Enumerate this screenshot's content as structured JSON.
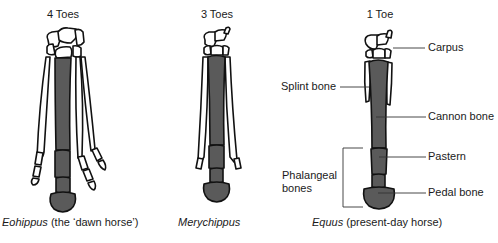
{
  "figure": {
    "panels": [
      {
        "id": "eohippus",
        "toe_count_label": "4 Toes",
        "caption_genus": "Eohippus",
        "caption_rest": " (the ‘dawn horse’)"
      },
      {
        "id": "merychippus",
        "toe_count_label": "3 Toes",
        "caption_genus": "Merychippus",
        "caption_rest": ""
      },
      {
        "id": "equus",
        "toe_count_label": "1 Toe",
        "caption_genus": "Equus",
        "caption_rest": " (present-day horse)"
      }
    ],
    "annotations": {
      "carpus": "Carpus",
      "splint_bone": "Splint bone",
      "cannon_bone": "Cannon bone",
      "pastern": "Pastern",
      "pedal_bone": "Pedal bone",
      "phalangeal_line1": "Phalangeal",
      "phalangeal_line2": "bones"
    },
    "colors": {
      "bone_fill_dark": "#5a5a5a",
      "bone_outline": "#111111",
      "bone_fill_light": "#ffffff",
      "leader_line": "#333333"
    }
  }
}
